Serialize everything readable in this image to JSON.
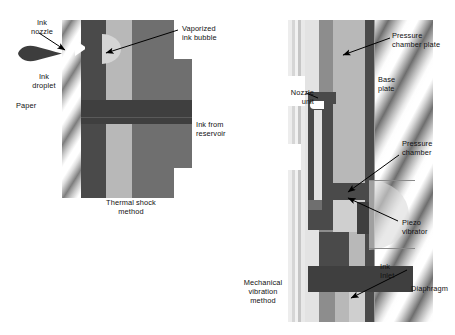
{
  "figure": {
    "title_semantic": "inkjet-printhead-cross-sections",
    "palette": {
      "ink_dark": "#4a4a4a",
      "body_mid": "#6f6f6f",
      "chamber_light": "#b8b8b8",
      "bubble": "#d5d5d5",
      "label_text": "#111111",
      "leader_line": "#000000",
      "background": "#ffffff"
    }
  },
  "left_diagram": {
    "name": "thermal-shock-method",
    "caption": "Thermal shock\nmethod",
    "labels": {
      "ink_nozzle": "Ink\nnozzle",
      "ink_droplet": "Ink\ndroplet",
      "paper": "Paper",
      "vaporized_ink_bubble": "Vaporized\nink bubble",
      "ink_from_reservoir": "Ink from\nreservoir"
    }
  },
  "right_diagram": {
    "name": "mechanical-vibration-method",
    "caption": "Mechanical\nvibration\nmethod",
    "labels": {
      "nozzle_unit": "Nozzle\nunit",
      "pressure_chamber_plate": "Pressure\nchamber plate",
      "base_plate": "Base\nplate",
      "pressure_chamber": "Pressure\nchamber",
      "piezo_vibrator": "Piezo\nvibrator",
      "ink_inlet": "Ink\nInlet",
      "diaphragm": "Diaphragm"
    }
  }
}
